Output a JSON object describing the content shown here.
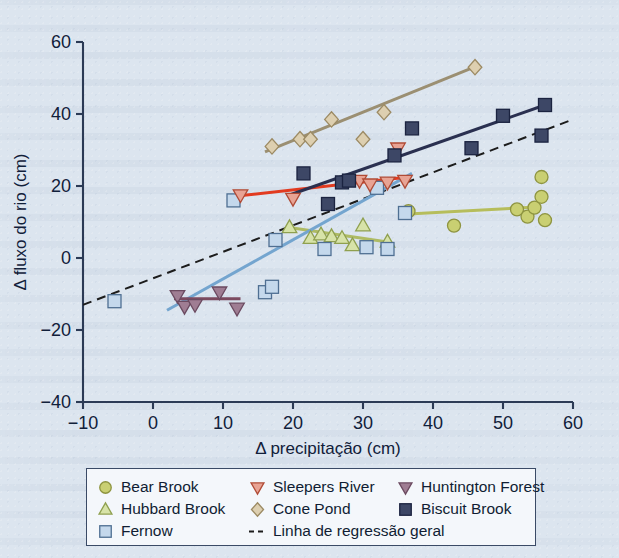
{
  "figure": {
    "background_color": "#dce5ef",
    "axis_color": "#2b3a55"
  },
  "chart_data": {
    "type": "scatter",
    "title": "",
    "xlabel": "Δ precipitação (cm)",
    "ylabel": "Δ fluxo do rio (cm)",
    "xlim": [
      -10,
      60
    ],
    "ylim": [
      -40,
      60
    ],
    "xticks": [
      -10,
      0,
      10,
      20,
      30,
      40,
      50,
      60
    ],
    "yticks": [
      -40,
      -20,
      0,
      20,
      40,
      60
    ],
    "grid": false,
    "legend_position": "below-plot",
    "series": [
      {
        "name": "Bear Brook",
        "marker": "circle",
        "color": "#c9cf72",
        "edge_color": "#8e9440",
        "points": [
          [
            36.5,
            13.0
          ],
          [
            43.0,
            9.0
          ],
          [
            52.0,
            13.5
          ],
          [
            53.5,
            11.5
          ],
          [
            54.5,
            14.0
          ],
          [
            55.5,
            22.5
          ],
          [
            55.5,
            17.0
          ],
          [
            56.0,
            10.5
          ]
        ],
        "trend_line": {
          "x": [
            36.5,
            55.0
          ],
          "y": [
            12.2,
            14.2
          ],
          "color": "#b6bd5b"
        }
      },
      {
        "name": "Hubbard Brook",
        "marker": "triangle-up",
        "color": "#d7e3a8",
        "edge_color": "#8fa04f",
        "points": [
          [
            19.5,
            8.5
          ],
          [
            22.5,
            5.5
          ],
          [
            24.0,
            6.5
          ],
          [
            25.5,
            6.0
          ],
          [
            27.0,
            5.5
          ],
          [
            28.5,
            3.5
          ],
          [
            30.0,
            9.0
          ],
          [
            33.5,
            4.5
          ]
        ],
        "trend_line": {
          "x": [
            19.0,
            34.0
          ],
          "y": [
            8.6,
            4.3
          ],
          "color": "#aebb64"
        }
      },
      {
        "name": "Fernow",
        "marker": "square",
        "color": "#c4d8ec",
        "edge_color": "#4f6f92",
        "points": [
          [
            -5.5,
            -12.0
          ],
          [
            11.5,
            16.0
          ],
          [
            16.0,
            -9.5
          ],
          [
            17.0,
            -8.0
          ],
          [
            17.5,
            5.0
          ],
          [
            24.5,
            2.5
          ],
          [
            30.5,
            3.0
          ],
          [
            32.0,
            19.5
          ],
          [
            33.5,
            2.5
          ],
          [
            36.0,
            12.5
          ]
        ],
        "trend_line": {
          "x": [
            2.0,
            37.0
          ],
          "y": [
            -14.5,
            23.5
          ],
          "color": "#74a5cf"
        }
      },
      {
        "name": "Sleepers River",
        "marker": "triangle-down",
        "color": "#e8a394",
        "edge_color": "#b04b36",
        "points": [
          [
            12.5,
            17.5
          ],
          [
            20.0,
            16.5
          ],
          [
            29.5,
            21.5
          ],
          [
            31.0,
            20.5
          ],
          [
            33.5,
            21.0
          ],
          [
            35.0,
            30.5
          ],
          [
            36.0,
            21.5
          ]
        ],
        "trend_line": {
          "x": [
            12.0,
            36.5
          ],
          "y": [
            17.2,
            22.5
          ],
          "color": "#e23b20"
        }
      },
      {
        "name": "Cone Pond",
        "marker": "diamond",
        "color": "#ddcfb0",
        "edge_color": "#9c8a63",
        "points": [
          [
            17.0,
            31.0
          ],
          [
            21.0,
            33.0
          ],
          [
            22.5,
            33.0
          ],
          [
            25.5,
            38.5
          ],
          [
            30.0,
            33.0
          ],
          [
            33.0,
            40.5
          ],
          [
            46.0,
            53.0
          ]
        ],
        "trend_line": {
          "x": [
            16.0,
            46.5
          ],
          "y": [
            29.5,
            53.5
          ],
          "color": "#9b8f72"
        }
      },
      {
        "name": "Huntington Forest",
        "marker": "triangle-down",
        "color": "#9f7d93",
        "edge_color": "#6b4a60",
        "points": [
          [
            3.5,
            -10.5
          ],
          [
            4.5,
            -13.5
          ],
          [
            6.0,
            -13.0
          ],
          [
            9.5,
            -9.5
          ],
          [
            12.0,
            -14.0
          ]
        ],
        "trend_line": {
          "x": [
            3.0,
            12.5
          ],
          "y": [
            -11.3,
            -11.3
          ],
          "color": "#7b4a5f"
        }
      },
      {
        "name": "Biscuit Brook",
        "marker": "square",
        "color": "#3d4766",
        "edge_color": "#1b2340",
        "points": [
          [
            21.5,
            23.5
          ],
          [
            25.0,
            15.0
          ],
          [
            27.0,
            21.0
          ],
          [
            28.0,
            21.5
          ],
          [
            34.5,
            28.5
          ],
          [
            37.0,
            36.0
          ],
          [
            45.5,
            30.5
          ],
          [
            50.0,
            39.5
          ],
          [
            55.5,
            34.0
          ],
          [
            56.0,
            42.5
          ]
        ],
        "trend_line": {
          "x": [
            19.5,
            56.0
          ],
          "y": [
            17.5,
            42.5
          ],
          "color": "#2a3050"
        }
      }
    ],
    "overall_regression": {
      "label": "Linha de regressão geral",
      "style": "dashed",
      "color": "#1c1c1c",
      "x": [
        -10.0,
        60.0
      ],
      "y": [
        -13.0,
        38.5
      ]
    }
  },
  "legend": {
    "entries": [
      {
        "label": "Bear Brook",
        "marker": "circle",
        "color": "#c9cf72",
        "edge_color": "#8e9440"
      },
      {
        "label": "Sleepers River",
        "marker": "triangle-down",
        "color": "#e8a394",
        "edge_color": "#b04b36"
      },
      {
        "label": "Huntington Forest",
        "marker": "triangle-down",
        "color": "#9f7d93",
        "edge_color": "#6b4a60"
      },
      {
        "label": "Hubbard Brook",
        "marker": "triangle-up",
        "color": "#d7e3a8",
        "edge_color": "#8fa04f"
      },
      {
        "label": "Cone Pond",
        "marker": "diamond",
        "color": "#ddcfb0",
        "edge_color": "#9c8a63"
      },
      {
        "label": "Biscuit Brook",
        "marker": "square",
        "color": "#3d4766",
        "edge_color": "#1b2340"
      },
      {
        "label": "Fernow",
        "marker": "square",
        "color": "#c4d8ec",
        "edge_color": "#4f6f92"
      },
      {
        "label": "Linha de regressão geral",
        "marker": "dashed-line",
        "color": "#1c1c1c",
        "edge_color": "#1c1c1c"
      }
    ]
  }
}
